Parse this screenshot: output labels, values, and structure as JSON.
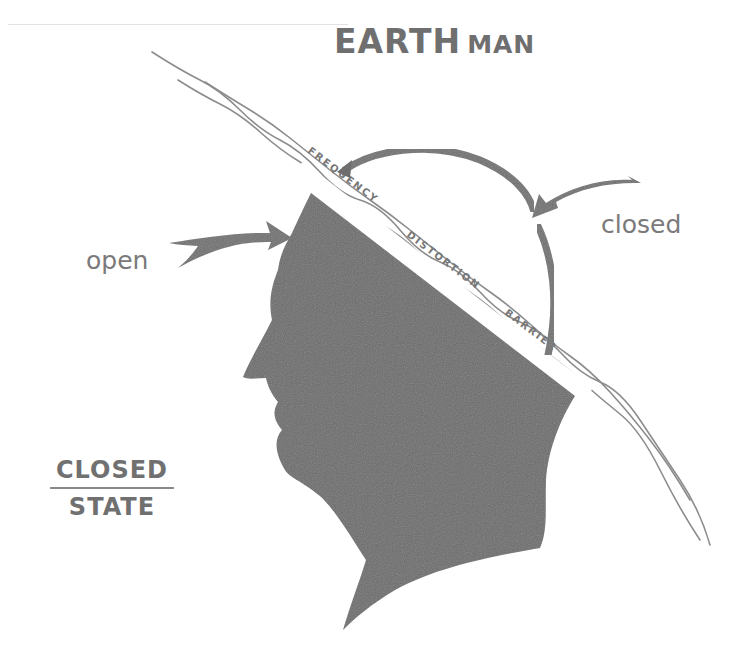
{
  "diagram": {
    "title": {
      "main": "EARTH",
      "secondary": "MAN"
    },
    "barrier_label": "FREQUENCY DISTORTION BARRIER",
    "barrier_words": [
      "FREQUENCY",
      "DISTORTION",
      "BARRIER"
    ],
    "arrows": [
      {
        "label": "open",
        "direction": "pointing right into forehead"
      },
      {
        "label": "closed",
        "direction": "pointing left onto arc above head"
      }
    ],
    "state_label": {
      "top": "CLOSED",
      "bottom": "STATE"
    },
    "colors": {
      "silhouette": "#6a6a6a",
      "text": "#737373",
      "lines": "#8a8a8a",
      "background": "#ffffff"
    }
  }
}
